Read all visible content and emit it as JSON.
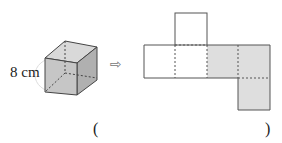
{
  "cube": {
    "edge_label": "8 cm",
    "shade_front": "#c8c8c8",
    "shade_top": "#dcdcdc",
    "shade_side": "#b4b4b4"
  },
  "arrow": {
    "glyph": "⇨"
  },
  "net": {
    "shade_color": "#dedede",
    "stroke_color": "#555555"
  },
  "answer": {
    "open_paren": "(",
    "close_paren": ")",
    "value": ""
  }
}
